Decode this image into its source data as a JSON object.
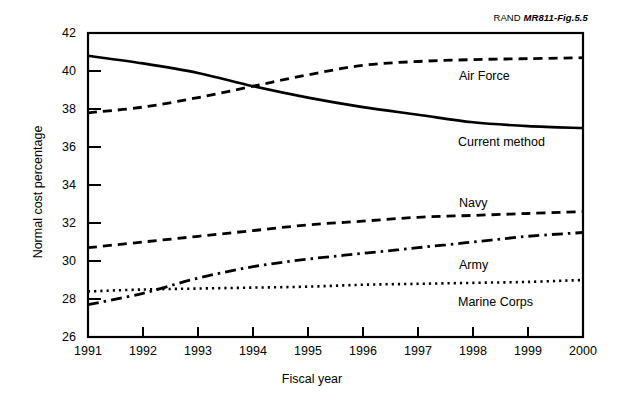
{
  "figure": {
    "credit_prefix": "RAND ",
    "credit_id": "MR811-Fig.5.5"
  },
  "chart_data": {
    "type": "line",
    "title": "",
    "xlabel": "Fiscal year",
    "ylabel": "Normal cost percentage",
    "x": [
      1991,
      1992,
      1993,
      1994,
      1995,
      1996,
      1997,
      1998,
      1999,
      2000
    ],
    "categories": [
      "1991",
      "1992",
      "1993",
      "1994",
      "1995",
      "1996",
      "1997",
      "1998",
      "1999",
      "2000"
    ],
    "xlim": [
      1991,
      2000
    ],
    "ylim": [
      26,
      42
    ],
    "yticks": [
      26,
      28,
      30,
      32,
      34,
      36,
      38,
      40,
      42
    ],
    "ytick_labels": [
      "26",
      "28",
      "30",
      "32",
      "34",
      "36",
      "38",
      "40",
      "42"
    ],
    "grid": false,
    "legend": "inline-labels",
    "series": [
      {
        "name": "Current method",
        "style": "solid",
        "values": [
          40.8,
          40.4,
          39.9,
          39.2,
          38.6,
          38.1,
          37.7,
          37.3,
          37.1,
          37.0
        ]
      },
      {
        "name": "Air Force",
        "style": "dashed",
        "values": [
          37.8,
          38.1,
          38.6,
          39.2,
          39.8,
          40.3,
          40.5,
          40.6,
          40.65,
          40.7
        ]
      },
      {
        "name": "Navy",
        "style": "dashed",
        "values": [
          30.7,
          31.0,
          31.3,
          31.6,
          31.9,
          32.1,
          32.3,
          32.4,
          32.5,
          32.6
        ]
      },
      {
        "name": "Army",
        "style": "dash-dot",
        "values": [
          27.7,
          28.3,
          29.1,
          29.7,
          30.1,
          30.4,
          30.7,
          31.0,
          31.3,
          31.5
        ]
      },
      {
        "name": "Marine Corps",
        "style": "dotted",
        "values": [
          28.4,
          28.5,
          28.55,
          28.6,
          28.65,
          28.75,
          28.8,
          28.85,
          28.9,
          29.0
        ]
      }
    ],
    "annotations": [
      {
        "text": "Air Force",
        "x": 1997.0,
        "y": 39.7
      },
      {
        "text": "Current method",
        "x": 1996.4,
        "y": 36.5
      },
      {
        "text": "Navy",
        "x": 1996.6,
        "y": 33.3
      },
      {
        "text": "Army",
        "x": 1996.6,
        "y": 30.0
      },
      {
        "text": "Marine Corps",
        "x": 1996.4,
        "y": 27.6
      }
    ],
    "colors": {
      "line": "#000000",
      "axis": "#000000",
      "background": "#ffffff"
    }
  }
}
